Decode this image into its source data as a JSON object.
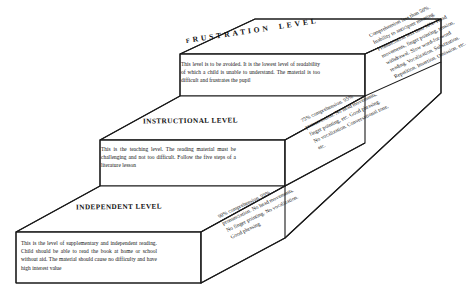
{
  "diagram": {
    "ink_color": "#1a1a1a",
    "background_color": "#ffffff",
    "levels": [
      {
        "id": "frustration",
        "heading": "FRUSTRATION LEVEL",
        "heading_lead_letter": "F",
        "heading_rest": "RUSTRATION",
        "heading_word2": "LEVEL",
        "body": "This level is to be avoided. It is the lowest level of readability of which a child is unable to understand. The material is too difficult and frustrates the pupil",
        "criteria": "Comprehension less than 50%. Inability to anticipate meaning. Pronunciation less than 90%. Head movements, finger pointing, tension, withdrawal. Slow word-for-word reading. Vocalization. Substitution. Repetition. Insertion. Omission. etc."
      },
      {
        "id": "instructional",
        "heading": "INSTRUCTIONAL LEVEL",
        "body": "This is the teaching level. The reading material must be challenging and not too difficult. Follow the five steps of a literature lesson",
        "criteria": "75% comprehension. 95% pronunciation. No head movements, finger pointing, etc. Good phrasing. No vocalization. Conversational tone, etc."
      },
      {
        "id": "independent",
        "heading": "INDEPENDENT LEVEL",
        "body": "This is the level of supplementary and independent reading. Child should be able to read the book at home or school without aid. The material should cause no difficulty and have high interest value",
        "criteria": "90% comprehension. 99% pronunciation. No head movements. No finger pointing. No vocalization. Good phrasing"
      }
    ]
  }
}
